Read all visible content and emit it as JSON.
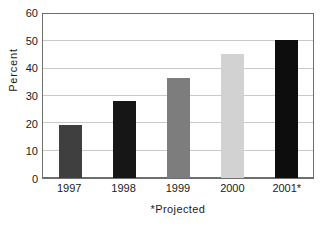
{
  "chart_data": {
    "type": "bar",
    "title": "",
    "subtitle": "",
    "categories": [
      "1997",
      "1998",
      "1999",
      "2000",
      "2001*"
    ],
    "values": [
      19.5,
      28,
      36.5,
      45.5,
      50.5
    ],
    "bar_colors": [
      "#3f3f3f",
      "#161616",
      "#7d7d7d",
      "#d2d2d2",
      "#0d0d0d"
    ],
    "xlabel": "*Projected",
    "ylabel": "Percent",
    "ylim": [
      0,
      60
    ],
    "ytick_values": [
      0,
      10,
      20,
      30,
      40,
      50,
      60
    ],
    "ytick_labels": [
      "0",
      "10",
      "20",
      "30",
      "40",
      "50",
      "60"
    ],
    "grid": true,
    "grid_axis": "y",
    "legend": false,
    "legend_position": "none",
    "annotations": [
      "*Projected"
    ],
    "axis_color": "#6e6e6e",
    "grid_color": "#c9c9c9",
    "text_color": "#1a1a1a",
    "background": "#ffffff"
  },
  "figure": {
    "title_remnant": ""
  }
}
